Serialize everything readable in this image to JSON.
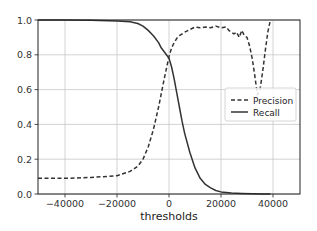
{
  "chart_data": {
    "type": "line",
    "title": "",
    "xlabel": "thresholds",
    "ylabel": "",
    "xlim": [
      -50400,
      50400
    ],
    "ylim": [
      0.0,
      1.0
    ],
    "grid": true,
    "legend_position": "center right",
    "x_ticks": [
      -40000,
      -20000,
      0,
      20000,
      40000
    ],
    "x_tick_labels": [
      "−40000",
      "−20000",
      "0",
      "20000",
      "40000"
    ],
    "y_ticks": [
      0.0,
      0.2,
      0.4,
      0.6,
      0.8,
      1.0
    ],
    "y_tick_labels": [
      "0.0",
      "0.2",
      "0.4",
      "0.6",
      "0.8",
      "1.0"
    ],
    "series": [
      {
        "name": "Precision",
        "style": "dashed",
        "color": "#333333",
        "x": [
          -50400,
          -40000,
          -30000,
          -20000,
          -15000,
          -12000,
          -10000,
          -8000,
          -6000,
          -4000,
          -2000,
          0,
          1000,
          2000,
          3000,
          4000,
          6000,
          8000,
          10000,
          12000,
          14000,
          16000,
          18000,
          20000,
          22000,
          23000,
          24000,
          25000,
          26000,
          27000,
          28000,
          29000,
          30000,
          31000,
          32000,
          33000,
          34000,
          35000,
          36000,
          37000,
          38000,
          39000
        ],
        "values": [
          0.09,
          0.09,
          0.095,
          0.105,
          0.13,
          0.16,
          0.2,
          0.27,
          0.37,
          0.5,
          0.65,
          0.79,
          0.84,
          0.87,
          0.895,
          0.91,
          0.93,
          0.945,
          0.96,
          0.955,
          0.96,
          0.955,
          0.965,
          0.955,
          0.96,
          0.94,
          0.93,
          0.92,
          0.93,
          0.9,
          0.94,
          0.91,
          0.9,
          0.85,
          0.78,
          0.68,
          0.57,
          0.6,
          0.7,
          0.82,
          0.93,
          1.0
        ]
      },
      {
        "name": "Recall",
        "style": "solid",
        "color": "#333333",
        "x": [
          -50400,
          -40000,
          -30000,
          -20000,
          -15000,
          -12000,
          -10000,
          -8000,
          -6000,
          -4000,
          -3000,
          -2000,
          -1000,
          0,
          1000,
          2000,
          3000,
          4000,
          5000,
          6000,
          8000,
          10000,
          12000,
          14000,
          16000,
          18000,
          20000,
          24000,
          28000,
          32000,
          36000,
          39000
        ],
        "values": [
          1.0,
          1.0,
          0.999,
          0.995,
          0.99,
          0.98,
          0.965,
          0.94,
          0.91,
          0.87,
          0.84,
          0.82,
          0.8,
          0.78,
          0.73,
          0.66,
          0.58,
          0.5,
          0.42,
          0.35,
          0.24,
          0.15,
          0.09,
          0.055,
          0.035,
          0.02,
          0.012,
          0.006,
          0.003,
          0.001,
          0.0005,
          0.0
        ]
      }
    ]
  },
  "legend": {
    "items": [
      {
        "label": "Precision",
        "style": "dashed"
      },
      {
        "label": "Recall",
        "style": "solid"
      }
    ]
  },
  "axes": {
    "xlabel": "thresholds"
  },
  "colors": {
    "line": "#333333",
    "grid": "#c8c8c8",
    "frame": "#222222",
    "background": "#ffffff"
  }
}
